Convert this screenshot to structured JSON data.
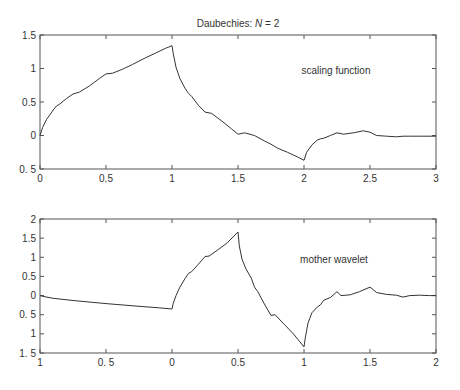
{
  "chart_data": [
    {
      "type": "line",
      "title": "Daubechies: N = 2",
      "title_prefix": "Daubechies: ",
      "title_var": "N",
      "title_suffix": " = 2",
      "annotation": "scaling function",
      "xlabel": "",
      "ylabel": "",
      "xlim": [
        0,
        3
      ],
      "ylim": [
        -0.5,
        1.5
      ],
      "xticks": [
        0,
        0.5,
        1,
        1.5,
        2,
        2.5,
        3
      ],
      "xtick_labels": [
        "0",
        "0.5",
        "1",
        "1.5",
        "2",
        "2.5",
        "3"
      ],
      "yticks": [
        -0.5,
        0,
        0.5,
        1,
        1.5
      ],
      "ytick_labels": [
        "0. 5",
        "0",
        "0.5",
        "1",
        "1.5"
      ],
      "grid": false,
      "series": [
        {
          "name": "scaling function",
          "x": [
            0,
            0.02,
            0.05,
            0.1,
            0.125,
            0.15,
            0.2,
            0.25,
            0.3,
            0.375,
            0.45,
            0.5,
            0.55,
            0.625,
            0.7,
            0.75,
            0.8,
            0.875,
            0.95,
            1.0,
            1.01,
            1.03,
            1.06,
            1.1,
            1.125,
            1.15,
            1.2,
            1.25,
            1.3,
            1.375,
            1.45,
            1.5,
            1.55,
            1.625,
            1.7,
            1.75,
            1.8,
            1.875,
            1.95,
            2.0,
            2.02,
            2.06,
            2.1,
            2.125,
            2.15,
            2.2,
            2.25,
            2.3,
            2.375,
            2.45,
            2.5,
            2.55,
            2.625,
            2.7,
            2.75,
            2.8,
            2.9,
            3.0
          ],
          "y": [
            0.0,
            0.12,
            0.24,
            0.38,
            0.44,
            0.47,
            0.55,
            0.62,
            0.65,
            0.74,
            0.85,
            0.92,
            0.93,
            0.99,
            1.06,
            1.11,
            1.16,
            1.23,
            1.3,
            1.34,
            1.22,
            1.02,
            0.85,
            0.7,
            0.63,
            0.58,
            0.45,
            0.35,
            0.33,
            0.22,
            0.1,
            0.02,
            0.04,
            0.0,
            -0.08,
            -0.13,
            -0.19,
            -0.25,
            -0.32,
            -0.37,
            -0.25,
            -0.14,
            -0.07,
            -0.05,
            -0.04,
            0.0,
            0.04,
            0.02,
            0.04,
            0.07,
            0.05,
            0.0,
            -0.01,
            -0.02,
            -0.01,
            -0.01,
            -0.01,
            -0.01
          ]
        }
      ]
    },
    {
      "type": "line",
      "annotation": "mother wavelet",
      "xlabel": "",
      "ylabel": "",
      "xlim": [
        -1,
        2
      ],
      "ylim": [
        -1.5,
        2
      ],
      "xticks": [
        -1,
        -0.5,
        0,
        0.5,
        1,
        1.5,
        2
      ],
      "xtick_labels": [
        "1",
        "0. 5",
        "0",
        "0.5",
        "1",
        "1.5",
        "2"
      ],
      "yticks": [
        -1.5,
        -1,
        -0.5,
        0,
        0.5,
        1,
        1.5,
        2
      ],
      "ytick_labels": [
        "1. 5",
        "1",
        "0. 5",
        "0",
        "0.5",
        "1",
        "1.5",
        "2"
      ],
      "grid": false,
      "series": [
        {
          "name": "mother wavelet",
          "x": [
            -1.0,
            -0.98,
            -0.9,
            -0.75,
            -0.5,
            -0.25,
            -0.1,
            0.0,
            0.01,
            0.03,
            0.06,
            0.1,
            0.125,
            0.15,
            0.2,
            0.25,
            0.28,
            0.35,
            0.42,
            0.5,
            0.51,
            0.53,
            0.56,
            0.6,
            0.625,
            0.65,
            0.7,
            0.75,
            0.78,
            0.85,
            0.92,
            1.0,
            1.01,
            1.03,
            1.06,
            1.1,
            1.125,
            1.15,
            1.2,
            1.25,
            1.28,
            1.35,
            1.42,
            1.5,
            1.55,
            1.625,
            1.7,
            1.75,
            1.8,
            1.875,
            1.95,
            2.0
          ],
          "y": [
            0.0,
            -0.02,
            -0.07,
            -0.13,
            -0.21,
            -0.28,
            -0.32,
            -0.35,
            -0.2,
            0.0,
            0.22,
            0.45,
            0.58,
            0.63,
            0.82,
            1.02,
            1.03,
            1.2,
            1.38,
            1.66,
            1.3,
            0.95,
            0.7,
            0.46,
            0.22,
            0.1,
            -0.22,
            -0.52,
            -0.5,
            -0.75,
            -1.0,
            -1.34,
            -1.1,
            -0.72,
            -0.45,
            -0.3,
            -0.24,
            -0.12,
            -0.05,
            0.1,
            0.0,
            0.02,
            0.1,
            0.22,
            0.08,
            0.03,
            0.01,
            -0.04,
            0.0,
            0.01,
            0.0,
            0.0
          ]
        }
      ]
    }
  ]
}
